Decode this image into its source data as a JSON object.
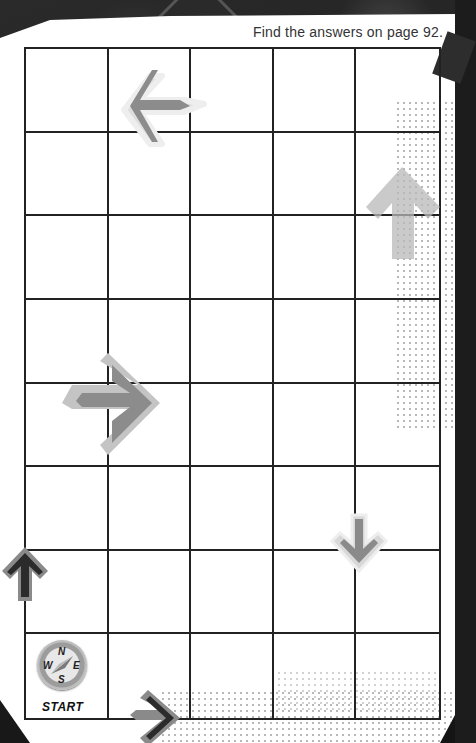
{
  "page": {
    "answers_note": "Find the answers on page 92."
  },
  "grid": {
    "columns": 5,
    "rows": 8
  },
  "arrows": [
    {
      "name": "left-arrow",
      "direction": "left",
      "style": "light-gray",
      "cell": "row 1, col 2"
    },
    {
      "name": "up-arrow-faded",
      "direction": "up",
      "style": "gray-dotted",
      "cell": "row 2-3, col 5"
    },
    {
      "name": "right-arrow",
      "direction": "right",
      "style": "gray",
      "cell": "row 5, col 1-2"
    },
    {
      "name": "down-arrow",
      "direction": "down",
      "style": "light-gray-small",
      "cell": "row 7, col 4-5"
    },
    {
      "name": "up-arrow-dark",
      "direction": "up",
      "style": "dark",
      "cell": "row 7, left edge"
    },
    {
      "name": "right-arrow-dark",
      "direction": "right",
      "style": "dark",
      "cell": "bottom edge, col 2"
    }
  ],
  "compass": {
    "north": "N",
    "south": "S",
    "east": "E",
    "west": "W",
    "label": "START"
  }
}
